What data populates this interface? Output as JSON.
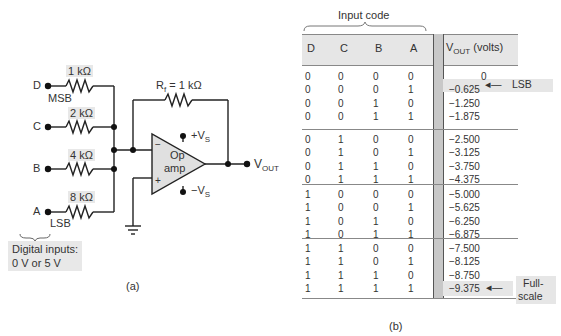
{
  "figure_a": {
    "caption": "(a)",
    "inputs": [
      {
        "name": "D",
        "resistor": "1 kΩ",
        "tag": "MSB"
      },
      {
        "name": "C",
        "resistor": "2 kΩ",
        "tag": ""
      },
      {
        "name": "B",
        "resistor": "4 kΩ",
        "tag": ""
      },
      {
        "name": "A",
        "resistor": "8 kΩ",
        "tag": "LSB"
      }
    ],
    "feedback_resistor": "R_f = 1 kΩ",
    "feedback_label_main": "R",
    "feedback_label_sub": "f",
    "feedback_label_rest": " = 1 kΩ",
    "opamp_line1": "Op",
    "opamp_line2": "amp",
    "minus_sign": "−",
    "plus_sign": "+",
    "pos_supply": "+V",
    "pos_supply_sub": "S",
    "neg_supply": "−V",
    "neg_supply_sub": "S",
    "output_label": "V",
    "output_label_sub": "OUT",
    "digital_inputs_line1": "Digital inputs:",
    "digital_inputs_line2": "0 V or 5 V"
  },
  "figure_b": {
    "caption": "(b)",
    "group_label": "Input code",
    "headers": [
      "D",
      "C",
      "B",
      "A"
    ],
    "vout_header_main": "V",
    "vout_header_sub": "OUT",
    "vout_header_rest": " (volts)",
    "rows": [
      {
        "bits": [
          "0",
          "0",
          "0",
          "0"
        ],
        "vout": "0"
      },
      {
        "bits": [
          "0",
          "0",
          "0",
          "1"
        ],
        "vout": "−0.625"
      },
      {
        "bits": [
          "0",
          "0",
          "1",
          "0"
        ],
        "vout": "−1.250"
      },
      {
        "bits": [
          "0",
          "0",
          "1",
          "1"
        ],
        "vout": "−1.875"
      },
      {
        "bits": [
          "0",
          "1",
          "0",
          "0"
        ],
        "vout": "−2.500"
      },
      {
        "bits": [
          "0",
          "1",
          "0",
          "1"
        ],
        "vout": "−3.125"
      },
      {
        "bits": [
          "0",
          "1",
          "1",
          "0"
        ],
        "vout": "−3.750"
      },
      {
        "bits": [
          "0",
          "1",
          "1",
          "1"
        ],
        "vout": "−4.375"
      },
      {
        "bits": [
          "1",
          "0",
          "0",
          "0"
        ],
        "vout": "−5.000"
      },
      {
        "bits": [
          "1",
          "0",
          "0",
          "1"
        ],
        "vout": "−5.625"
      },
      {
        "bits": [
          "1",
          "0",
          "1",
          "0"
        ],
        "vout": "−6.250"
      },
      {
        "bits": [
          "1",
          "0",
          "1",
          "1"
        ],
        "vout": "−6.875"
      },
      {
        "bits": [
          "1",
          "1",
          "0",
          "0"
        ],
        "vout": "−7.500"
      },
      {
        "bits": [
          "1",
          "1",
          "0",
          "1"
        ],
        "vout": "−8.125"
      },
      {
        "bits": [
          "1",
          "1",
          "1",
          "0"
        ],
        "vout": "−8.750"
      },
      {
        "bits": [
          "1",
          "1",
          "1",
          "1"
        ],
        "vout": "−9.375"
      }
    ],
    "lsb_annotation": "LSB",
    "fullscale_line1": "Full-",
    "fullscale_line2": "scale"
  }
}
